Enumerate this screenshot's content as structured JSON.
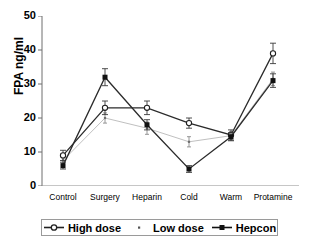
{
  "chart_data": {
    "type": "line",
    "title": "",
    "xlabel": "",
    "ylabel": "FPA ng/ml",
    "categories": [
      "Control",
      "Surgery",
      "Heparin",
      "Cold",
      "Warm",
      "Protamine"
    ],
    "ylim": [
      0,
      50
    ],
    "yticks": [
      0,
      10,
      20,
      30,
      40,
      50
    ],
    "grid": false,
    "legend_position": "bottom",
    "error_bars": "standard error",
    "series": [
      {
        "name": "High dose",
        "marker": "open-circle",
        "color": "#2b2b2b",
        "values": [
          9.0,
          23.0,
          23.0,
          18.5,
          15.0,
          39.0
        ],
        "errors": [
          1.5,
          2.0,
          2.0,
          1.5,
          1.5,
          3.0
        ]
      },
      {
        "name": "Low dose",
        "marker": "small-dot",
        "color": "#c0c0c0",
        "values": [
          7.5,
          20.0,
          17.0,
          13.0,
          14.8,
          31.5
        ],
        "errors": [
          1.2,
          1.5,
          1.8,
          1.5,
          1.2,
          2.0
        ]
      },
      {
        "name": "Hepcon",
        "marker": "filled-square",
        "color": "#2b2b2b",
        "values": [
          6.0,
          32.0,
          18.0,
          5.0,
          14.5,
          31.0
        ],
        "errors": [
          1.0,
          2.5,
          1.5,
          1.0,
          1.2,
          2.0
        ]
      }
    ]
  },
  "legend": {
    "items": [
      {
        "label": "High dose"
      },
      {
        "label": "Low dose"
      },
      {
        "label": "Hepcon"
      }
    ]
  }
}
